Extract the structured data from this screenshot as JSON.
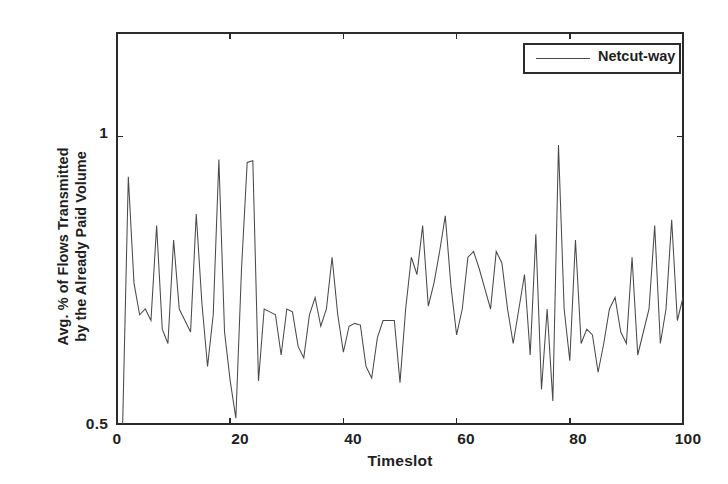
{
  "figure": {
    "background_color": "#ffffff",
    "axis_color": "#2b2b2b",
    "series_color": "#4a4a4a"
  },
  "legend": {
    "position": "top-right",
    "entries": [
      {
        "label": "Netcut-way",
        "color": "#4a4a4a"
      }
    ]
  },
  "axes": {
    "x_title": "Timeslot",
    "y_title_line1": "Avg. % of Flows Transmitted",
    "y_title_line2": "by the Already Paid Volume",
    "x_ticks": [
      "0",
      "20",
      "40",
      "60",
      "80",
      "100"
    ],
    "y_ticks": [
      "0.5",
      "1"
    ]
  },
  "chart_data": {
    "type": "line",
    "title": "",
    "xlabel": "Timeslot",
    "ylabel": "Avg. % of Flows Transmitted by the Already Paid Volume",
    "xlim": [
      0,
      100
    ],
    "ylim": [
      0.5,
      1.18
    ],
    "xticks": [
      0,
      20,
      40,
      60,
      80,
      100
    ],
    "yticks": [
      0.5,
      1.0
    ],
    "grid": false,
    "legend_position": "upper right",
    "series": [
      {
        "name": "Netcut-way",
        "color": "#4a4a4a",
        "x": [
          1,
          2,
          3,
          4,
          5,
          6,
          7,
          8,
          9,
          10,
          11,
          12,
          13,
          14,
          15,
          16,
          17,
          18,
          19,
          20,
          21,
          22,
          23,
          24,
          25,
          26,
          27,
          28,
          29,
          30,
          31,
          32,
          33,
          34,
          35,
          36,
          37,
          38,
          39,
          40,
          41,
          42,
          43,
          44,
          45,
          46,
          47,
          48,
          49,
          50,
          51,
          52,
          53,
          54,
          55,
          56,
          57,
          58,
          59,
          60,
          61,
          62,
          63,
          64,
          65,
          66,
          67,
          68,
          69,
          70,
          71,
          72,
          73,
          74,
          75,
          76,
          77,
          78,
          79,
          80,
          81,
          82,
          83,
          84,
          85,
          86,
          87,
          88,
          89,
          90,
          91,
          92,
          93,
          94,
          95,
          96,
          97,
          98,
          99,
          100
        ],
        "y": [
          0.5,
          0.93,
          0.745,
          0.69,
          0.7,
          0.68,
          0.845,
          0.665,
          0.64,
          0.82,
          0.7,
          0.68,
          0.66,
          0.865,
          0.71,
          0.6,
          0.69,
          0.96,
          0.66,
          0.575,
          0.51,
          0.77,
          0.955,
          0.958,
          0.575,
          0.7,
          0.695,
          0.69,
          0.62,
          0.7,
          0.695,
          0.635,
          0.615,
          0.69,
          0.72,
          0.67,
          0.7,
          0.79,
          0.69,
          0.625,
          0.67,
          0.675,
          0.672,
          0.6,
          0.58,
          0.65,
          0.68,
          0.68,
          0.68,
          0.572,
          0.7,
          0.79,
          0.76,
          0.845,
          0.705,
          0.745,
          0.8,
          0.862,
          0.74,
          0.655,
          0.7,
          0.79,
          0.8,
          0.77,
          0.735,
          0.7,
          0.8,
          0.78,
          0.7,
          0.64,
          0.7,
          0.76,
          0.62,
          0.83,
          0.56,
          0.7,
          0.54,
          0.985,
          0.7,
          0.61,
          0.82,
          0.64,
          0.665,
          0.655,
          0.59,
          0.64,
          0.7,
          0.72,
          0.66,
          0.64,
          0.79,
          0.62,
          0.66,
          0.7,
          0.845,
          0.64,
          0.7,
          0.855,
          0.68,
          0.72
        ]
      }
    ]
  }
}
